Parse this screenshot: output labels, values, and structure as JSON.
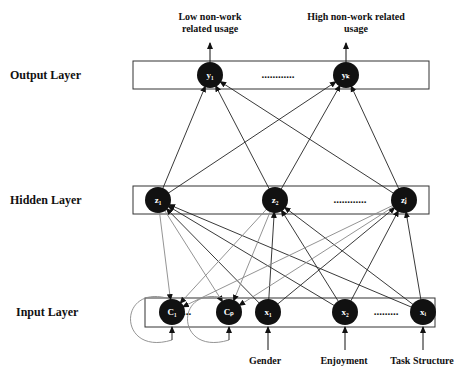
{
  "diagram": {
    "type": "neural-network",
    "layers": [
      {
        "id": "output",
        "label": "Output Layer",
        "nodes": [
          {
            "id": "y1",
            "label": "y₁"
          },
          {
            "id": "yk",
            "label": "yₖ"
          }
        ],
        "ellipsis": "............"
      },
      {
        "id": "hidden",
        "label": "Hidden Layer",
        "nodes": [
          {
            "id": "z1",
            "label": "z₁"
          },
          {
            "id": "z2",
            "label": "z₂"
          },
          {
            "id": "zj",
            "label": "zⱼ"
          }
        ],
        "ellipsis": "............"
      },
      {
        "id": "input",
        "label": "Input Layer",
        "nodes": [
          {
            "id": "C1",
            "label": "C₁"
          },
          {
            "id": "Cp",
            "label": "Cₚ"
          },
          {
            "id": "x1",
            "label": "x₁"
          },
          {
            "id": "x2",
            "label": "x₂"
          },
          {
            "id": "xi",
            "label": "xᵢ"
          }
        ],
        "ellipsis": ".........",
        "context_ellipsis": "..."
      }
    ],
    "outputs": [
      {
        "node": "y1",
        "line1": "Low non-work",
        "line2": "related usage"
      },
      {
        "node": "yk",
        "line1": "High non-work related",
        "line2": "usage"
      }
    ],
    "inputs": [
      {
        "node": "x1",
        "label": "Gender"
      },
      {
        "node": "x2",
        "label": "Enjoyment"
      },
      {
        "node": "xi",
        "label": "Task Structure"
      }
    ],
    "edges_hidden_to_output": [
      [
        "z1",
        "y1"
      ],
      [
        "z1",
        "yk"
      ],
      [
        "z2",
        "y1"
      ],
      [
        "z2",
        "yk"
      ],
      [
        "zj",
        "y1"
      ],
      [
        "zj",
        "yk"
      ]
    ],
    "edges_input_to_hidden": [
      [
        "x1",
        "z1"
      ],
      [
        "x1",
        "z2"
      ],
      [
        "x1",
        "zj"
      ],
      [
        "x2",
        "z1"
      ],
      [
        "x2",
        "z2"
      ],
      [
        "x2",
        "zj"
      ],
      [
        "xi",
        "z1"
      ],
      [
        "xi",
        "z2"
      ],
      [
        "xi",
        "zj"
      ]
    ],
    "edges_hidden_to_context": [
      [
        "z1",
        "C1"
      ],
      [
        "z1",
        "Cp"
      ],
      [
        "z2",
        "C1"
      ],
      [
        "z2",
        "Cp"
      ],
      [
        "zj",
        "C1"
      ],
      [
        "zj",
        "Cp"
      ]
    ],
    "self_loops": [
      "C1",
      "Cp"
    ],
    "colors": {
      "node": "#111111",
      "edge": "#222222",
      "context_edge": "#888888",
      "box": "#333333"
    }
  }
}
